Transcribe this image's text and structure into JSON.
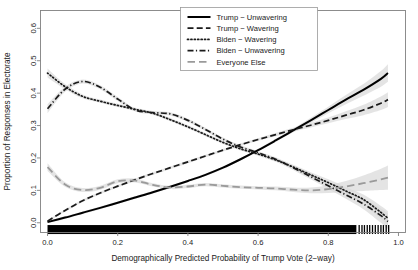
{
  "chart_data": {
    "type": "line",
    "title": "",
    "xlabel": "Demographically Predicted Probability of Trump Vote (2−way)",
    "ylabel": "Proportion of Responses in Electorate",
    "xlim": [
      -0.02,
      1.02
    ],
    "ylim": [
      -0.03,
      0.655
    ],
    "xticks": [
      0.0,
      0.2,
      0.4,
      0.6,
      0.8,
      1.0
    ],
    "xticklabels": [
      "0.0",
      "0.2",
      "0.4",
      "0.6",
      "0.8",
      "1.0"
    ],
    "yticks": [
      0.0,
      0.1,
      0.2,
      0.3,
      0.4,
      0.5,
      0.6
    ],
    "yticklabels": [
      "0.0",
      "0.1",
      "0.2",
      "0.3",
      "0.4",
      "0.5",
      "0.6"
    ],
    "grid": false,
    "legend_position": "top-center",
    "confidence_bands": true,
    "rug_plot": true,
    "x": [
      0.0,
      0.05,
      0.1,
      0.15,
      0.2,
      0.25,
      0.3,
      0.35,
      0.4,
      0.45,
      0.5,
      0.55,
      0.6,
      0.65,
      0.7,
      0.75,
      0.8,
      0.85,
      0.9,
      0.95,
      0.97
    ],
    "series": [
      {
        "name": "Trump − Unwavering",
        "style": "solid",
        "color": "#000000",
        "width": 2.0,
        "values": [
          0.002,
          0.016,
          0.031,
          0.046,
          0.062,
          0.078,
          0.094,
          0.111,
          0.129,
          0.148,
          0.17,
          0.196,
          0.224,
          0.254,
          0.285,
          0.316,
          0.348,
          0.38,
          0.41,
          0.444,
          0.462
        ],
        "ci_low": [
          0.0,
          0.012,
          0.027,
          0.042,
          0.058,
          0.074,
          0.09,
          0.107,
          0.125,
          0.144,
          0.166,
          0.192,
          0.22,
          0.249,
          0.279,
          0.308,
          0.338,
          0.366,
          0.392,
          0.42,
          0.435
        ],
        "ci_high": [
          0.006,
          0.02,
          0.035,
          0.05,
          0.066,
          0.082,
          0.098,
          0.115,
          0.133,
          0.152,
          0.174,
          0.2,
          0.228,
          0.259,
          0.291,
          0.324,
          0.358,
          0.394,
          0.428,
          0.468,
          0.489
        ]
      },
      {
        "name": "Trump − Wavering",
        "style": "dashed",
        "color": "#1a1a1a",
        "width": 1.7,
        "values": [
          0.005,
          0.038,
          0.068,
          0.092,
          0.113,
          0.133,
          0.152,
          0.17,
          0.188,
          0.206,
          0.224,
          0.241,
          0.257,
          0.272,
          0.287,
          0.301,
          0.316,
          0.332,
          0.348,
          0.369,
          0.38
        ],
        "ci_low": [
          0.002,
          0.034,
          0.064,
          0.088,
          0.109,
          0.129,
          0.148,
          0.166,
          0.184,
          0.202,
          0.22,
          0.237,
          0.253,
          0.267,
          0.281,
          0.294,
          0.307,
          0.32,
          0.332,
          0.348,
          0.357
        ],
        "ci_high": [
          0.008,
          0.042,
          0.072,
          0.096,
          0.117,
          0.137,
          0.156,
          0.174,
          0.192,
          0.21,
          0.228,
          0.245,
          0.261,
          0.277,
          0.293,
          0.308,
          0.325,
          0.344,
          0.364,
          0.39,
          0.403
        ]
      },
      {
        "name": "Biden − Wavering",
        "style": "dotted",
        "color": "#1a1a1a",
        "width": 1.7,
        "values": [
          0.462,
          0.42,
          0.39,
          0.375,
          0.362,
          0.35,
          0.338,
          0.318,
          0.296,
          0.272,
          0.248,
          0.228,
          0.212,
          0.194,
          0.172,
          0.148,
          0.124,
          0.098,
          0.072,
          0.032,
          0.014
        ],
        "ci_low": [
          0.448,
          0.412,
          0.384,
          0.37,
          0.357,
          0.345,
          0.333,
          0.313,
          0.291,
          0.267,
          0.243,
          0.223,
          0.207,
          0.188,
          0.165,
          0.14,
          0.114,
          0.086,
          0.057,
          0.012,
          -0.008
        ],
        "ci_high": [
          0.476,
          0.428,
          0.396,
          0.38,
          0.367,
          0.355,
          0.343,
          0.323,
          0.301,
          0.277,
          0.253,
          0.233,
          0.217,
          0.2,
          0.179,
          0.156,
          0.134,
          0.11,
          0.087,
          0.052,
          0.036
        ]
      },
      {
        "name": "Biden − Unwavering",
        "style": "dashdot",
        "color": "#1a1a1a",
        "width": 1.7,
        "values": [
          0.352,
          0.412,
          0.436,
          0.418,
          0.382,
          0.348,
          0.34,
          0.336,
          0.316,
          0.288,
          0.258,
          0.234,
          0.216,
          0.196,
          0.17,
          0.142,
          0.114,
          0.086,
          0.058,
          0.022,
          0.004
        ],
        "ci_low": [
          0.338,
          0.404,
          0.43,
          0.412,
          0.376,
          0.343,
          0.335,
          0.331,
          0.311,
          0.283,
          0.253,
          0.229,
          0.211,
          0.19,
          0.163,
          0.134,
          0.104,
          0.074,
          0.042,
          0.0,
          -0.02
        ],
        "ci_high": [
          0.366,
          0.42,
          0.442,
          0.424,
          0.388,
          0.353,
          0.345,
          0.341,
          0.321,
          0.293,
          0.263,
          0.239,
          0.221,
          0.202,
          0.177,
          0.15,
          0.124,
          0.098,
          0.074,
          0.044,
          0.028
        ]
      },
      {
        "name": "Everyone Else",
        "style": "longdash",
        "color": "#9a9a9a",
        "width": 1.8,
        "values": [
          0.172,
          0.118,
          0.101,
          0.108,
          0.128,
          0.13,
          0.117,
          0.109,
          0.112,
          0.118,
          0.114,
          0.11,
          0.108,
          0.106,
          0.102,
          0.1,
          0.104,
          0.112,
          0.122,
          0.134,
          0.139
        ],
        "ci_low": [
          0.16,
          0.111,
          0.095,
          0.102,
          0.122,
          0.124,
          0.112,
          0.104,
          0.107,
          0.113,
          0.109,
          0.105,
          0.103,
          0.1,
          0.095,
          0.091,
          0.092,
          0.095,
          0.098,
          0.101,
          0.102
        ],
        "ci_high": [
          0.184,
          0.125,
          0.107,
          0.114,
          0.134,
          0.136,
          0.122,
          0.114,
          0.117,
          0.123,
          0.119,
          0.115,
          0.113,
          0.112,
          0.109,
          0.109,
          0.116,
          0.129,
          0.146,
          0.167,
          0.177
        ]
      }
    ],
    "rug_dense_range": [
      0.0,
      0.88
    ],
    "rug_sparse_ticks": [
      0.888,
      0.896,
      0.903,
      0.911,
      0.918,
      0.926,
      0.934,
      0.942,
      0.95,
      0.957,
      0.965,
      0.972
    ]
  },
  "legend": {
    "items": [
      {
        "label": "Trump − Unwavering"
      },
      {
        "label": "Trump − Wavering"
      },
      {
        "label": "Biden − Wavering"
      },
      {
        "label": "Biden − Unwavering"
      },
      {
        "label": "Everyone Else"
      }
    ]
  }
}
